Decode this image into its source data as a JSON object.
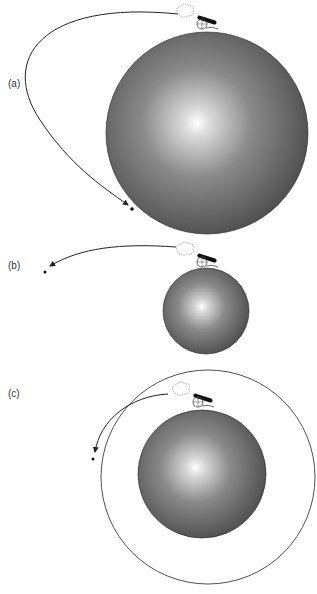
{
  "panels": [
    {
      "label": "(a)",
      "description": "Cannonball launched with low speed falls back to the planet"
    },
    {
      "label": "(b)",
      "description": "Cannonball launched faster travels further before landing"
    },
    {
      "label": "(c)",
      "description": "Cannonball launched at orbital speed circles the planet"
    }
  ],
  "colors": {
    "planet_dark": "#3a3a3a",
    "planet_light": "#ffffff",
    "stroke": "#222222"
  }
}
